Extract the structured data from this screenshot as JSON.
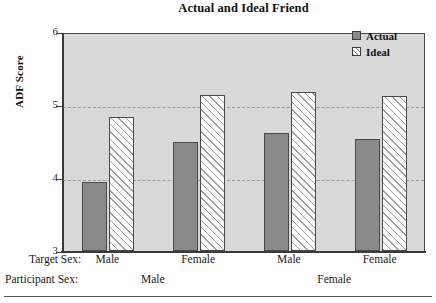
{
  "chart_data": {
    "type": "bar",
    "title": "Actual and Ideal Friend",
    "xlabel": "",
    "ylabel": "ADF Score",
    "ylim": [
      3,
      6
    ],
    "yticks": [
      3,
      4,
      5,
      6
    ],
    "ytick_labels": [
      "3",
      "4",
      "5",
      "6"
    ],
    "gridlines": [
      4,
      5
    ],
    "grid": true,
    "legend_position": "top-right",
    "categories": [
      "Male",
      "Female",
      "Male",
      "Female"
    ],
    "group_labels": [
      "Male",
      "Female"
    ],
    "series": [
      {
        "name": "Actual",
        "color": "#8a8a8a",
        "fill": "solid-gray",
        "values": [
          3.95,
          4.5,
          4.61,
          4.53
        ]
      },
      {
        "name": "Ideal",
        "color": "#ffffff",
        "fill": "diagonal-hatch",
        "values": [
          4.83,
          5.14,
          5.18,
          5.13
        ]
      }
    ],
    "axis_rows": [
      {
        "title": "Target Sex:",
        "values": [
          "Male",
          "Female",
          "Male",
          "Female"
        ]
      },
      {
        "title": "Participant Sex:",
        "values": [
          "Male",
          "Female"
        ]
      }
    ]
  },
  "chart": {
    "title": "Actual and Ideal Friend",
    "y_axis_title": "ADF Score",
    "y_ticks": [
      {
        "label": "6",
        "value": 6
      },
      {
        "label": "5",
        "value": 5
      },
      {
        "label": "4",
        "value": 4
      },
      {
        "label": "3",
        "value": 3
      }
    ],
    "legend": [
      {
        "label": "Actual",
        "style": "actual"
      },
      {
        "label": "Ideal",
        "style": "ideal"
      }
    ],
    "target_sex": {
      "row_title": "Target Sex:",
      "labels": [
        "Male",
        "Female",
        "Male",
        "Female"
      ]
    },
    "participant_sex": {
      "row_title": "Participant Sex:",
      "labels": [
        "Male",
        "Female"
      ]
    },
    "colors": {
      "plot_background": "#d9d9d9",
      "actual_bar": "#8a8a8a",
      "ideal_bar": "#ffffff",
      "axis": "#3a3a3a",
      "gridline": "#9a9a9a"
    }
  }
}
